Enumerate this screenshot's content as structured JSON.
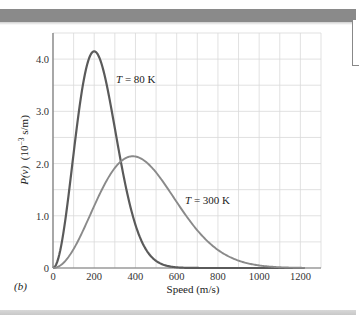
{
  "figure": {
    "panel_label": "(b)"
  },
  "chart_data": {
    "type": "line",
    "title": "",
    "panel_label": "(b)",
    "xlabel": "Speed (m/s)",
    "ylabel": "P(v) (10^-3 s/m)",
    "xlim": [
      0,
      1300
    ],
    "ylim": [
      0,
      4.5
    ],
    "x_ticks": [
      0,
      200,
      400,
      600,
      800,
      1000,
      1200
    ],
    "x_tick_labels": [
      "0",
      "200",
      "400",
      "600",
      "800",
      "1000",
      "1200"
    ],
    "y_ticks": [
      0,
      1.0,
      2.0,
      3.0,
      4.0
    ],
    "y_tick_labels": [
      "0",
      "1.0",
      "2.0",
      "3.0",
      "4.0"
    ],
    "grid": true,
    "grid_x_step": 100,
    "grid_y_step": 0.5,
    "legend": "none (inline annotations)",
    "series": [
      {
        "name": "T = 80 K",
        "color": "#5a5a5a",
        "peak": {
          "x": 200,
          "y": 4.15
        },
        "x": [
          0,
          25,
          50,
          75,
          100,
          125,
          150,
          175,
          200,
          225,
          250,
          275,
          300,
          325,
          350,
          375,
          400,
          450,
          500,
          550,
          600,
          700,
          800,
          1000,
          1200
        ],
        "y": [
          0,
          0.17,
          0.62,
          1.22,
          1.83,
          2.47,
          3.1,
          3.63,
          4.15,
          4.1,
          3.85,
          3.41,
          2.98,
          2.45,
          1.93,
          1.5,
          1.12,
          0.55,
          0.22,
          0.07,
          0.02,
          0.0,
          0.0,
          0.0,
          0.0
        ]
      },
      {
        "name": "T = 300 K",
        "color": "#8a8a8a",
        "peak": {
          "x": 387,
          "y": 2.14
        },
        "x": [
          0,
          50,
          100,
          150,
          200,
          250,
          300,
          350,
          387,
          450,
          500,
          550,
          600,
          650,
          700,
          750,
          800,
          850,
          900,
          1000,
          1100,
          1200
        ],
        "y": [
          0,
          0.09,
          0.35,
          0.74,
          1.18,
          1.59,
          1.9,
          2.1,
          2.14,
          2.03,
          1.85,
          1.6,
          1.32,
          1.05,
          0.8,
          0.58,
          0.41,
          0.28,
          0.18,
          0.07,
          0.02,
          0.01
        ]
      }
    ],
    "annotations": [
      {
        "text": "T = 80 K",
        "x": 265,
        "y": 3.78
      },
      {
        "text": "T = 300 K",
        "x": 655,
        "y": 1.27
      }
    ]
  },
  "labels": {
    "x_axis": "Speed (m/s)",
    "y_axis_prefix": "P(v)",
    "y_axis_units": "(10",
    "y_axis_exp": "−3",
    "y_axis_units_end": " s/m)",
    "annotation_80k_T": "T",
    "annotation_80k_rest": " = 80 K",
    "annotation_300k_T": "T",
    "annotation_300k_rest": " = 300 K"
  }
}
